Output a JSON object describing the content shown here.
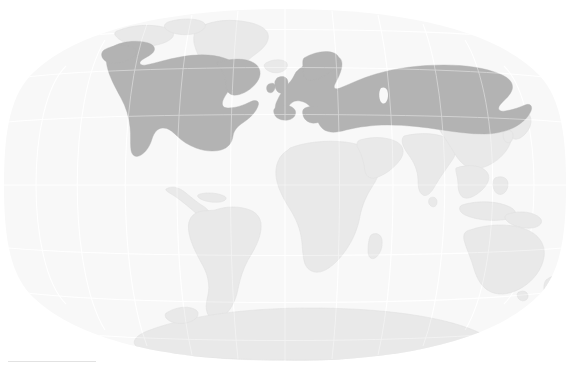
{
  "map": {
    "title": "World Map",
    "projection": "Winkel Tripel",
    "width": 570,
    "height": 370,
    "graticule": {
      "visible": true,
      "meridian_step_deg": 30,
      "parallel_step_deg": 30,
      "color": "#ffffff"
    },
    "colors": {
      "background": "#ffffff",
      "ocean": "#f8f8f8",
      "land_default": "#e9e9e9",
      "land_highlight": "#b3b3b3",
      "border": "#e0e0e0",
      "graticule": "#ffffff",
      "scale_rule": "#e2e2e2"
    },
    "legend": {
      "visible": false,
      "labels": []
    },
    "scale_rule": {
      "visible": true,
      "label": ""
    },
    "regions": [
      {
        "id": "north-america",
        "name": "North America",
        "highlighted": true
      },
      {
        "id": "europe-russia",
        "name": "Europe and Russia",
        "highlighted": true
      },
      {
        "id": "greenland",
        "name": "Greenland",
        "highlighted": false
      },
      {
        "id": "south-america",
        "name": "South America",
        "highlighted": false
      },
      {
        "id": "africa",
        "name": "Africa",
        "highlighted": false
      },
      {
        "id": "middle-east",
        "name": "Middle East",
        "highlighted": false
      },
      {
        "id": "south-asia",
        "name": "South Asia",
        "highlighted": false
      },
      {
        "id": "east-asia",
        "name": "East Asia",
        "highlighted": false
      },
      {
        "id": "southeast-asia",
        "name": "Southeast Asia",
        "highlighted": false
      },
      {
        "id": "australia",
        "name": "Australia",
        "highlighted": false
      },
      {
        "id": "new-zealand",
        "name": "New Zealand",
        "highlighted": false
      },
      {
        "id": "antarctica",
        "name": "Antarctica",
        "highlighted": false
      },
      {
        "id": "caspian-sea",
        "name": "Caspian Sea",
        "highlighted": false
      }
    ]
  }
}
